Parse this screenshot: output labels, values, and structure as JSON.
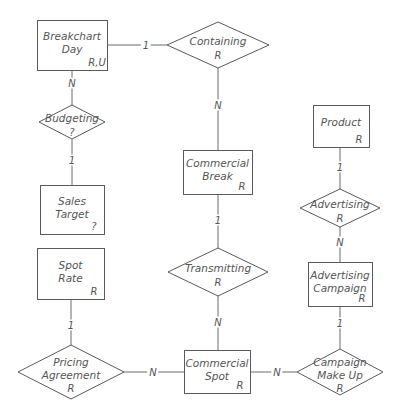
{
  "diagram": {
    "type": "entity-relationship",
    "colors": {
      "line": "#6a6a6a",
      "text": "#555555",
      "background": "#ffffff"
    },
    "entities": [
      {
        "id": "breakchart_day",
        "label": [
          "Breakchart",
          "Day"
        ],
        "tag": "R,U",
        "x": 37,
        "y": 20,
        "w": 70,
        "h": 50
      },
      {
        "id": "sales_target",
        "label": [
          "Sales",
          "Target"
        ],
        "tag": "?",
        "x": 40,
        "y": 185,
        "w": 64,
        "h": 49
      },
      {
        "id": "spot_rate",
        "label": [
          "Spot",
          "Rate"
        ],
        "tag": "R",
        "x": 37,
        "y": 248,
        "w": 67,
        "h": 51
      },
      {
        "id": "commercial_break",
        "label": [
          "Commercial",
          "Break"
        ],
        "tag": "R",
        "x": 183,
        "y": 150,
        "w": 69,
        "h": 44
      },
      {
        "id": "commercial_spot",
        "label": [
          "Commercial",
          "Spot"
        ],
        "tag": "R",
        "x": 184,
        "y": 350,
        "w": 66,
        "h": 43
      },
      {
        "id": "product",
        "label": [
          "Product"
        ],
        "tag": "R",
        "x": 313,
        "y": 105,
        "w": 56,
        "h": 42
      },
      {
        "id": "advertising_campaign",
        "label": [
          "Advertising",
          "Campaign"
        ],
        "tag": "R",
        "x": 308,
        "y": 262,
        "w": 64,
        "h": 44
      }
    ],
    "relationships": [
      {
        "id": "containing",
        "label": [
          "Containing"
        ],
        "tag": "R",
        "cx": 218,
        "cy": 45,
        "hw": 51,
        "hh": 23
      },
      {
        "id": "budgeting",
        "label": [
          "Budgeting"
        ],
        "tag": "?",
        "cx": 72,
        "cy": 122,
        "hw": 33,
        "hh": 17
      },
      {
        "id": "transmitting",
        "label": [
          "Transmitting"
        ],
        "tag": "R",
        "cx": 218,
        "cy": 272,
        "hw": 50,
        "hh": 24
      },
      {
        "id": "pricing_agreement",
        "label": [
          "Pricing",
          "Agreement"
        ],
        "tag": "R",
        "cx": 71,
        "cy": 372,
        "hw": 53,
        "hh": 27
      },
      {
        "id": "advertising",
        "label": [
          "Advertising"
        ],
        "tag": "R",
        "cx": 340,
        "cy": 208,
        "hw": 40,
        "hh": 19
      },
      {
        "id": "campaign_make_up",
        "label": [
          "Campaign",
          "Make Up"
        ],
        "tag": "R",
        "cx": 340,
        "cy": 372,
        "hw": 43,
        "hh": 23
      }
    ],
    "connections": [
      {
        "from": "breakchart_day",
        "to": "containing",
        "cardinality": "1",
        "x1": 107,
        "y1": 45,
        "x2": 167,
        "y2": 45,
        "lx": 146,
        "ly": 45
      },
      {
        "from": "containing",
        "to": "commercial_break",
        "cardinality": "N",
        "x1": 218,
        "y1": 68,
        "x2": 218,
        "y2": 150,
        "lx": 218,
        "ly": 105
      },
      {
        "from": "breakchart_day",
        "to": "budgeting",
        "cardinality": "N",
        "x1": 72,
        "y1": 70,
        "x2": 72,
        "y2": 105,
        "lx": 72,
        "ly": 83
      },
      {
        "from": "budgeting",
        "to": "sales_target",
        "cardinality": "1",
        "x1": 72,
        "y1": 139,
        "x2": 72,
        "y2": 185,
        "lx": 72,
        "ly": 160
      },
      {
        "from": "commercial_break",
        "to": "transmitting",
        "cardinality": "1",
        "x1": 218,
        "y1": 194,
        "x2": 218,
        "y2": 248,
        "lx": 218,
        "ly": 220
      },
      {
        "from": "transmitting",
        "to": "commercial_spot",
        "cardinality": "N",
        "x1": 218,
        "y1": 296,
        "x2": 218,
        "y2": 350,
        "lx": 218,
        "ly": 322
      },
      {
        "from": "spot_rate",
        "to": "pricing_agreement",
        "cardinality": "1",
        "x1": 71,
        "y1": 299,
        "x2": 71,
        "y2": 345,
        "lx": 71,
        "ly": 325
      },
      {
        "from": "pricing_agreement",
        "to": "commercial_spot",
        "cardinality": "N",
        "x1": 124,
        "y1": 372,
        "x2": 184,
        "y2": 372,
        "lx": 153,
        "ly": 372
      },
      {
        "from": "commercial_spot",
        "to": "campaign_make_up",
        "cardinality": "N",
        "x1": 250,
        "y1": 372,
        "x2": 297,
        "y2": 372,
        "lx": 277,
        "ly": 372
      },
      {
        "from": "product",
        "to": "advertising",
        "cardinality": "1",
        "x1": 340,
        "y1": 147,
        "x2": 340,
        "y2": 189,
        "lx": 340,
        "ly": 167
      },
      {
        "from": "advertising",
        "to": "advertising_campaign",
        "cardinality": "N",
        "x1": 340,
        "y1": 227,
        "x2": 340,
        "y2": 262,
        "lx": 340,
        "ly": 242
      },
      {
        "from": "advertising_campaign",
        "to": "campaign_make_up",
        "cardinality": "1",
        "x1": 340,
        "y1": 306,
        "x2": 340,
        "y2": 349,
        "lx": 340,
        "ly": 323
      }
    ]
  }
}
